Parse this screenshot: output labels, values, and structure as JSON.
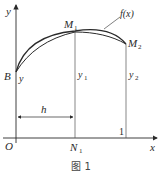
{
  "figure": {
    "caption": "图 1",
    "axes": {
      "x_label": "x",
      "y_label": "y",
      "origin_label": "O"
    },
    "points": {
      "B": "B",
      "M1_main": "M",
      "M1_sub": "1",
      "M2_main": "M",
      "M2_sub": "2",
      "N1_main": "N",
      "N1_sub": "1"
    },
    "curve_label": "f(x)",
    "ordinates": {
      "y_at_B": "y",
      "y1_main": "y",
      "y1_sub": "1",
      "y2_main": "y",
      "y2_sub": "2"
    },
    "step_label": "h",
    "tick_label": "1",
    "colors": {
      "line": "#2a2a2a",
      "thin_line": "#555555"
    }
  }
}
